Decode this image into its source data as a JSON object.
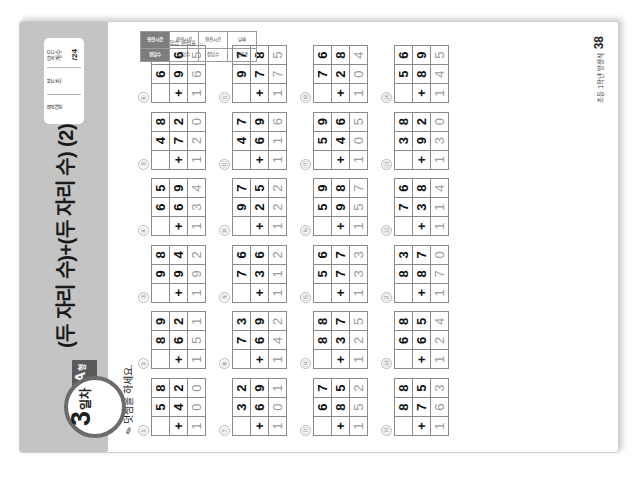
{
  "page": {
    "unit_title": "(두 자리 수)+(두 자리 수) (2)",
    "day_number": "3",
    "day_suffix": "일차",
    "type_letter": "A",
    "type_word": "형",
    "instruction": "덧셈을 하세요.",
    "pencil_icon": "pencil-icon",
    "page_number": "38",
    "footer_text": "초등 1학년 방정식"
  },
  "score_box": {
    "columns": [
      {
        "label": "월\n일",
        "value": ""
      },
      {
        "label": "분\n초",
        "value": ""
      },
      {
        "label": "맞은\n개수",
        "value": "/24"
      }
    ]
  },
  "grade_strip": {
    "caption": "스스로 학습 관리표 ···",
    "cells": [
      "정답수",
      "걸린시간",
      "정답수",
      "걸린시간",
      "정답수",
      "걸린시간",
      "확인란",
      "날짜"
    ]
  },
  "problems": [
    [
      {
        "no": "①",
        "a": "58",
        "b": "42",
        "sum": "100"
      },
      {
        "no": "②",
        "a": "89",
        "b": "62",
        "sum": "151"
      },
      {
        "no": "③",
        "a": "98",
        "b": "94",
        "sum": "192"
      },
      {
        "no": "④",
        "a": "65",
        "b": "69",
        "sum": "134"
      },
      {
        "no": "⑤",
        "a": "48",
        "b": "72",
        "sum": "120"
      },
      {
        "no": "⑥",
        "a": "69",
        "b": "96",
        "sum": "165"
      }
    ],
    [
      {
        "no": "⑦",
        "a": "32",
        "b": "69",
        "sum": "101"
      },
      {
        "no": "⑧",
        "a": "73",
        "b": "69",
        "sum": "142"
      },
      {
        "no": "⑨",
        "a": "76",
        "b": "36",
        "sum": "112"
      },
      {
        "no": "⑩",
        "a": "97",
        "b": "25",
        "sum": "122"
      },
      {
        "no": "⑪",
        "a": "47",
        "b": "69",
        "sum": "116"
      },
      {
        "no": "⑫",
        "a": "97",
        "b": "78",
        "sum": "175"
      }
    ],
    [
      {
        "no": "⑬",
        "a": "67",
        "b": "85",
        "sum": "152"
      },
      {
        "no": "⑭",
        "a": "88",
        "b": "37",
        "sum": "125"
      },
      {
        "no": "⑮",
        "a": "56",
        "b": "77",
        "sum": "133"
      },
      {
        "no": "⑯",
        "a": "59",
        "b": "98",
        "sum": "157"
      },
      {
        "no": "⑰",
        "a": "59",
        "b": "46",
        "sum": "105"
      },
      {
        "no": "⑱",
        "a": "76",
        "b": "28",
        "sum": "104"
      }
    ],
    [
      {
        "no": "⑲",
        "a": "88",
        "b": "75",
        "sum": "163"
      },
      {
        "no": "⑳",
        "a": "68",
        "b": "65",
        "sum": "124"
      },
      {
        "no": "㉑",
        "a": "83",
        "b": "87",
        "sum": "170"
      },
      {
        "no": "㉒",
        "a": "76",
        "b": "38",
        "sum": "114"
      },
      {
        "no": "㉓",
        "a": "38",
        "b": "92",
        "sum": "130"
      },
      {
        "no": "㉔",
        "a": "56",
        "b": "89",
        "sum": "145"
      }
    ]
  ],
  "operator": "+"
}
